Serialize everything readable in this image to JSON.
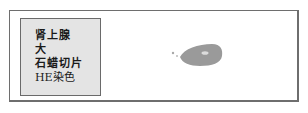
{
  "slide": {
    "label": {
      "lines": [
        "肾上腺",
        "大",
        "石蜡切片",
        "HE染色"
      ]
    },
    "specimen": {
      "description": "tissue-section",
      "color": "#9a9a9a",
      "highlight_color": "#dcdcdc"
    },
    "colors": {
      "border": "#6e6e6e",
      "label_background": "#e4e4e4",
      "text": "#1a1a1a"
    }
  }
}
